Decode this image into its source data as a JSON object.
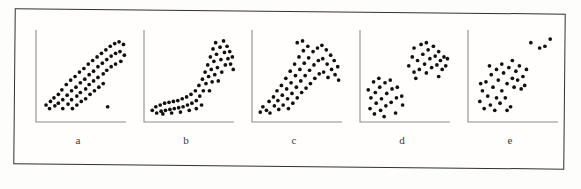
{
  "figure": {
    "caption_labels": [
      "a",
      "b",
      "c",
      "d",
      "e"
    ],
    "frame_color": "#33312f",
    "dot_color": "#101010",
    "axis_color": "#8e8b86",
    "background_color": "#fffefc"
  },
  "chart_data": [
    {
      "type": "scatter",
      "title": "a",
      "pattern": "strong positive linear association with one low outlier",
      "xlabel": "",
      "ylabel": "",
      "xlim": [
        0,
        100
      ],
      "ylim": [
        0,
        100
      ],
      "grid": false,
      "legend": "none",
      "points": [
        [
          8,
          18
        ],
        [
          13,
          22
        ],
        [
          12,
          14
        ],
        [
          17,
          26
        ],
        [
          18,
          17
        ],
        [
          22,
          30
        ],
        [
          22,
          20
        ],
        [
          26,
          35
        ],
        [
          27,
          24
        ],
        [
          27,
          14
        ],
        [
          31,
          41
        ],
        [
          32,
          29
        ],
        [
          33,
          19
        ],
        [
          36,
          46
        ],
        [
          37,
          34
        ],
        [
          37,
          24
        ],
        [
          38,
          14
        ],
        [
          41,
          50
        ],
        [
          42,
          38
        ],
        [
          43,
          28
        ],
        [
          43,
          18
        ],
        [
          46,
          55
        ],
        [
          47,
          43
        ],
        [
          47,
          32
        ],
        [
          48,
          22
        ],
        [
          51,
          59
        ],
        [
          52,
          47
        ],
        [
          53,
          36
        ],
        [
          53,
          25
        ],
        [
          56,
          64
        ],
        [
          57,
          52
        ],
        [
          57,
          41
        ],
        [
          58,
          30
        ],
        [
          61,
          68
        ],
        [
          62,
          56
        ],
        [
          62,
          45
        ],
        [
          63,
          34
        ],
        [
          66,
          72
        ],
        [
          67,
          61
        ],
        [
          67,
          49
        ],
        [
          68,
          38
        ],
        [
          71,
          76
        ],
        [
          72,
          65
        ],
        [
          73,
          53
        ],
        [
          73,
          42
        ],
        [
          76,
          80
        ],
        [
          77,
          69
        ],
        [
          77,
          57
        ],
        [
          81,
          84
        ],
        [
          82,
          73
        ],
        [
          82,
          61
        ],
        [
          86,
          87
        ],
        [
          87,
          76
        ],
        [
          87,
          64
        ],
        [
          91,
          89
        ],
        [
          92,
          78
        ],
        [
          93,
          67
        ],
        [
          96,
          86
        ],
        [
          97,
          74
        ],
        [
          78,
          16
        ]
      ]
    },
    {
      "type": "scatter",
      "title": "b",
      "pattern": "curvilinear J-shaped exponential association",
      "xlabel": "",
      "ylabel": "",
      "xlim": [
        0,
        100
      ],
      "ylim": [
        0,
        100
      ],
      "grid": false,
      "legend": "none",
      "points": [
        [
          6,
          12
        ],
        [
          10,
          16
        ],
        [
          11,
          9
        ],
        [
          15,
          18
        ],
        [
          16,
          11
        ],
        [
          20,
          20
        ],
        [
          21,
          12
        ],
        [
          25,
          21
        ],
        [
          26,
          13
        ],
        [
          30,
          22
        ],
        [
          31,
          14
        ],
        [
          35,
          23
        ],
        [
          36,
          15
        ],
        [
          40,
          25
        ],
        [
          41,
          16
        ],
        [
          45,
          27
        ],
        [
          46,
          18
        ],
        [
          50,
          30
        ],
        [
          51,
          20
        ],
        [
          55,
          34
        ],
        [
          56,
          23
        ],
        [
          59,
          40
        ],
        [
          60,
          28
        ],
        [
          63,
          47
        ],
        [
          64,
          34
        ],
        [
          66,
          55
        ],
        [
          67,
          42
        ],
        [
          69,
          63
        ],
        [
          70,
          50
        ],
        [
          71,
          34
        ],
        [
          72,
          72
        ],
        [
          73,
          58
        ],
        [
          74,
          44
        ],
        [
          75,
          81
        ],
        [
          76,
          67
        ],
        [
          77,
          52
        ],
        [
          78,
          88
        ],
        [
          79,
          75
        ],
        [
          80,
          60
        ],
        [
          81,
          45
        ],
        [
          83,
          83
        ],
        [
          84,
          69
        ],
        [
          85,
          55
        ],
        [
          87,
          90
        ],
        [
          88,
          77
        ],
        [
          89,
          63
        ],
        [
          91,
          84
        ],
        [
          92,
          70
        ],
        [
          94,
          78
        ],
        [
          95,
          64
        ],
        [
          97,
          72
        ],
        [
          98,
          58
        ],
        [
          62,
          18
        ],
        [
          56,
          14
        ],
        [
          48,
          12
        ],
        [
          38,
          10
        ],
        [
          28,
          9
        ],
        [
          18,
          8
        ]
      ]
    },
    {
      "type": "scatter",
      "title": "c",
      "pattern": "fan-shaped heteroscedastic spread widening with x",
      "xlabel": "",
      "ylabel": "",
      "xlim": [
        0,
        100
      ],
      "ylim": [
        0,
        100
      ],
      "grid": false,
      "legend": "none",
      "points": [
        [
          6,
          10
        ],
        [
          9,
          16
        ],
        [
          13,
          12
        ],
        [
          16,
          22
        ],
        [
          17,
          9
        ],
        [
          21,
          27
        ],
        [
          22,
          17
        ],
        [
          25,
          34
        ],
        [
          26,
          23
        ],
        [
          27,
          13
        ],
        [
          30,
          40
        ],
        [
          31,
          29
        ],
        [
          32,
          18
        ],
        [
          35,
          48
        ],
        [
          36,
          36
        ],
        [
          37,
          25
        ],
        [
          38,
          14
        ],
        [
          40,
          56
        ],
        [
          41,
          43
        ],
        [
          42,
          31
        ],
        [
          43,
          20
        ],
        [
          45,
          64
        ],
        [
          46,
          51
        ],
        [
          47,
          38
        ],
        [
          48,
          26
        ],
        [
          50,
          72
        ],
        [
          51,
          58
        ],
        [
          52,
          45
        ],
        [
          53,
          32
        ],
        [
          55,
          79
        ],
        [
          56,
          65
        ],
        [
          57,
          51
        ],
        [
          58,
          37
        ],
        [
          60,
          84
        ],
        [
          61,
          71
        ],
        [
          62,
          57
        ],
        [
          63,
          42
        ],
        [
          66,
          78
        ],
        [
          67,
          63
        ],
        [
          68,
          48
        ],
        [
          71,
          82
        ],
        [
          72,
          68
        ],
        [
          73,
          53
        ],
        [
          76,
          85
        ],
        [
          77,
          70
        ],
        [
          78,
          55
        ],
        [
          81,
          80
        ],
        [
          82,
          64
        ],
        [
          83,
          49
        ],
        [
          86,
          74
        ],
        [
          87,
          58
        ],
        [
          90,
          68
        ],
        [
          91,
          52
        ],
        [
          94,
          61
        ],
        [
          95,
          46
        ],
        [
          48,
          88
        ],
        [
          54,
          90
        ]
      ]
    },
    {
      "type": "scatter",
      "title": "d",
      "pattern": "two distinct clusters with no overall association",
      "xlabel": "",
      "ylabel": "",
      "xlim": [
        0,
        100
      ],
      "ylim": [
        0,
        100
      ],
      "grid": false,
      "legend": "none",
      "clusters": [
        {
          "name": "lower-left cluster",
          "points": [
            [
              8,
              14
            ],
            [
              13,
              8
            ],
            [
              9,
              26
            ],
            [
              15,
              20
            ],
            [
              20,
              12
            ],
            [
              14,
              32
            ],
            [
              21,
              25
            ],
            [
              26,
              17
            ],
            [
              19,
              38
            ],
            [
              27,
              31
            ],
            [
              32,
              21
            ],
            [
              25,
              43
            ],
            [
              33,
              36
            ],
            [
              38,
              26
            ],
            [
              31,
              46
            ],
            [
              39,
              38
            ],
            [
              44,
              28
            ],
            [
              37,
              9
            ],
            [
              24,
              5
            ],
            [
              12,
              44
            ],
            [
              18,
              48
            ],
            [
              45,
              18
            ],
            [
              6,
              35
            ]
          ]
        },
        {
          "name": "upper-right cluster",
          "points": [
            [
              52,
              62
            ],
            [
              58,
              55
            ],
            [
              56,
              72
            ],
            [
              62,
              68
            ],
            [
              64,
              58
            ],
            [
              68,
              75
            ],
            [
              70,
              64
            ],
            [
              72,
              54
            ],
            [
              74,
              80
            ],
            [
              76,
              70
            ],
            [
              78,
              60
            ],
            [
              80,
              84
            ],
            [
              82,
              73
            ],
            [
              84,
              63
            ],
            [
              86,
              78
            ],
            [
              88,
              68
            ],
            [
              90,
              58
            ],
            [
              92,
              72
            ],
            [
              66,
              86
            ],
            [
              58,
              82
            ],
            [
              94,
              62
            ],
            [
              72,
              88
            ],
            [
              96,
              70
            ],
            [
              60,
              48
            ],
            [
              86,
              50
            ]
          ]
        }
      ]
    },
    {
      "type": "scatter",
      "title": "e",
      "pattern": "single dense cluster with a small group of outliers",
      "xlabel": "",
      "ylabel": "",
      "xlim": [
        0,
        100
      ],
      "ylim": [
        0,
        100
      ],
      "grid": false,
      "legend": "none",
      "clusters": [
        {
          "name": "main cluster",
          "points": [
            [
              10,
              22
            ],
            [
              15,
              14
            ],
            [
              13,
              34
            ],
            [
              19,
              28
            ],
            [
              22,
              18
            ],
            [
              17,
              44
            ],
            [
              25,
              38
            ],
            [
              29,
              26
            ],
            [
              23,
              52
            ],
            [
              31,
              46
            ],
            [
              35,
              34
            ],
            [
              27,
              12
            ],
            [
              37,
              54
            ],
            [
              41,
              42
            ],
            [
              33,
              20
            ],
            [
              43,
              60
            ],
            [
              47,
              48
            ],
            [
              39,
              26
            ],
            [
              49,
              38
            ],
            [
              51,
              56
            ],
            [
              45,
              16
            ],
            [
              53,
              46
            ],
            [
              55,
              62
            ],
            [
              59,
              50
            ],
            [
              57,
              36
            ],
            [
              21,
              62
            ],
            [
              35,
              64
            ],
            [
              47,
              68
            ],
            [
              11,
              42
            ],
            [
              63,
              58
            ],
            [
              61,
              40
            ],
            [
              29,
              58
            ],
            [
              41,
              12
            ]
          ]
        },
        {
          "name": "outliers",
          "points": [
            [
              68,
              88
            ],
            [
              78,
              82
            ],
            [
              84,
              84
            ],
            [
              90,
              92
            ]
          ]
        }
      ]
    }
  ]
}
